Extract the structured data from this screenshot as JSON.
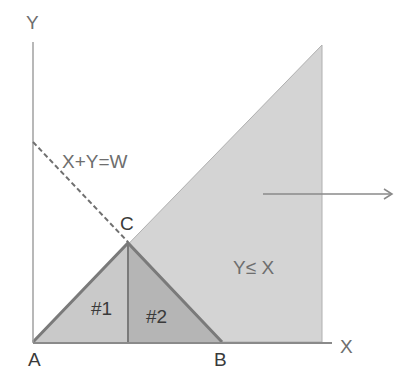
{
  "diagram": {
    "axes": {
      "x_label": "X",
      "y_label": "Y"
    },
    "line_label": "X+Y=W",
    "region_label": "Y≤ X",
    "points": {
      "a": "A",
      "b": "B",
      "c": "C"
    },
    "regions": {
      "r1": "#1",
      "r2": "#2"
    },
    "colors": {
      "region_fill": "#d4d4d4",
      "triangle1_fill": "#c8c8c8",
      "triangle2_fill": "#b4b4b4",
      "edge": "#777777",
      "axis": "#9a9a9a",
      "text": "#6e6e6e"
    }
  }
}
